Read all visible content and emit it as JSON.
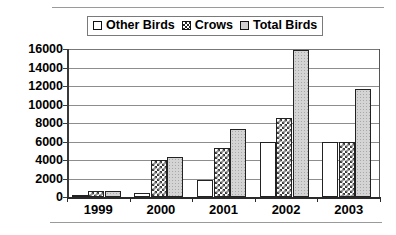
{
  "legend": {
    "items": [
      {
        "label": "Other Birds",
        "swatch": "legend-swatch-plain-white"
      },
      {
        "label": "Crows",
        "swatch": "legend-swatch-crosshatch"
      },
      {
        "label": "Total Birds",
        "swatch": "legend-swatch-gray"
      }
    ]
  },
  "axis": {
    "y_ticks": [
      "16000",
      "14000",
      "12000",
      "10000",
      "8000",
      "6000",
      "4000",
      "2000",
      "0"
    ],
    "x_ticks": [
      "1999",
      "2000",
      "2001",
      "2002",
      "2003"
    ]
  },
  "colors": {
    "other_birds": "#ffffff",
    "crows": "#3a3a3a",
    "total_birds": "#d4d4d4",
    "axis": "#2a2a2a",
    "gridline": "#8d8d8d"
  },
  "chart_data": {
    "type": "bar",
    "title": "",
    "subtitle": "",
    "xlabel": "",
    "ylabel": "",
    "categories": [
      "1999",
      "2000",
      "2001",
      "2002",
      "2003"
    ],
    "series": [
      {
        "name": "Other Birds",
        "values": [
          100,
          400,
          1800,
          6000,
          6000
        ]
      },
      {
        "name": "Crows",
        "values": [
          600,
          4000,
          5300,
          8500,
          6000
        ]
      },
      {
        "name": "Total Birds",
        "values": [
          700,
          4350,
          7300,
          15900,
          11700
        ]
      }
    ],
    "ylim": [
      0,
      16000
    ],
    "ytick_step": 2000,
    "grid": true,
    "legend_position": "top-center"
  }
}
